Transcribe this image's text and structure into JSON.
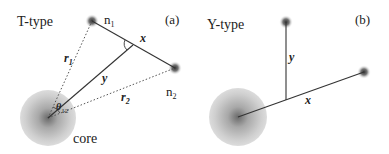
{
  "panels": [
    {
      "id": "a",
      "type_label": "T-type",
      "panel_label": "(a)",
      "node1_label": "n",
      "node1_sub": "1",
      "node2_label": "n",
      "node2_sub": "2",
      "core_label": "core",
      "x_label": "x",
      "y_label": "y",
      "r1_label": "r",
      "r1_sub": "1",
      "r2_label": "r",
      "r2_sub": "2",
      "theta_label": "θ",
      "theta_sub": "12"
    },
    {
      "id": "b",
      "type_label": "Y-type",
      "panel_label": "(b)",
      "x_label": "x",
      "y_label": "y"
    }
  ],
  "colors": {
    "line": "#333333",
    "dotted": "#555555",
    "core_outer": "#d0d0d0",
    "core_inner": "#707070",
    "node": "#444444"
  }
}
